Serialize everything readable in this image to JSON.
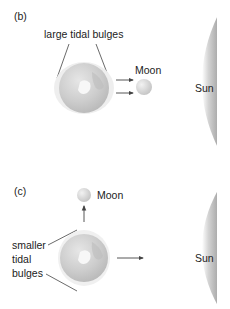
{
  "panels": [
    {
      "id": "b",
      "label": "(b)",
      "bulge_label": "large tidal bulges",
      "moon_label": "Moon",
      "sun_label": "Sun",
      "moon_direction": "aligned with Sun (spring tide)"
    },
    {
      "id": "c",
      "label": "(c)",
      "bulge_label_lines": [
        "smaller",
        "tidal",
        "bulges"
      ],
      "moon_label": "Moon",
      "sun_label": "Sun",
      "moon_direction": "perpendicular to Sun (neap tide)"
    }
  ],
  "colors": {
    "earth": "#c9c9c9",
    "earth_dark": "#a8a8a8",
    "moon": "#d8d8d8",
    "sun": "#b5b5b5",
    "line": "#444444"
  }
}
